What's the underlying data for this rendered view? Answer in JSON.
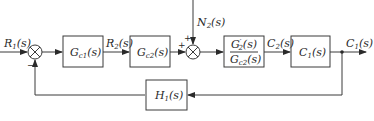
{
  "diagram": {
    "type": "control-block-diagram",
    "signals": {
      "input": {
        "main": "R",
        "sub": "1",
        "arg": "(s)"
      },
      "intermediate": {
        "main": "R",
        "sub": "2",
        "arg": "(s)"
      },
      "disturbance": {
        "main": "N",
        "sub": "2",
        "arg": "(s)"
      },
      "inner_output": {
        "main": "C",
        "sub": "2",
        "arg": "(s)"
      },
      "output": {
        "main": "C",
        "sub": "1",
        "arg": "(s)"
      }
    },
    "blocks": [
      {
        "id": "gc1",
        "main": "G",
        "sub": "c1",
        "arg": "(s)"
      },
      {
        "id": "gc2",
        "main": "G",
        "sub": "c2",
        "arg": "(s)"
      },
      {
        "id": "g2ratio",
        "numerator": {
          "main": "G",
          "sup": "′",
          "sub": "2",
          "arg": "(s)"
        },
        "denominator": {
          "main": "G",
          "sub": "c2",
          "arg": "(s)"
        }
      },
      {
        "id": "c1",
        "main": "C",
        "sub": "1",
        "arg": "(s)"
      },
      {
        "id": "h1",
        "main": "H",
        "sub": "1",
        "arg": "(s)"
      }
    ],
    "summing_junctions": [
      {
        "id": "sum1",
        "signs": {
          "left": "",
          "bottom": "−"
        }
      },
      {
        "id": "sum2",
        "signs": {
          "left": "+",
          "top": "+"
        }
      }
    ],
    "colors": {
      "stroke": "#3a3a3a",
      "text": "#2a2a2a",
      "background": "#ffffff"
    }
  }
}
